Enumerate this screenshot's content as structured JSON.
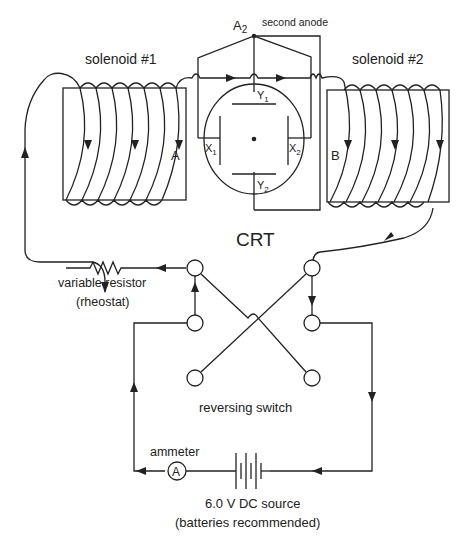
{
  "labels": {
    "solenoid1": "solenoid #1",
    "solenoid2": "solenoid #2",
    "anode_symbol": "A",
    "anode_sub": "2",
    "second_anode": "second anode",
    "y1": "Y",
    "y1_sub": "1",
    "y2": "Y",
    "y2_sub": "2",
    "x1": "X",
    "x1_sub": "1",
    "x2": "X",
    "x2_sub": "2",
    "point_a": "A",
    "point_b": "B",
    "crt": "CRT",
    "resistor_line1": "variable resistor",
    "resistor_line2": "(rheostat)",
    "switch": "reversing switch",
    "ammeter": "ammeter",
    "ammeter_symbol": "A",
    "source_line1": "6.0 V DC source",
    "source_line2": "(batteries recommended)"
  },
  "colors": {
    "ink": "#222222",
    "background": "#ffffff"
  }
}
